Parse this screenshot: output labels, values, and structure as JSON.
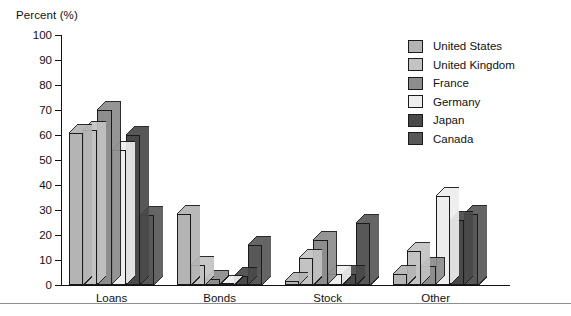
{
  "chart_data": {
    "type": "bar",
    "title": "",
    "ylabel": "Percent (%)",
    "xlabel": "",
    "ylim": [
      0,
      100
    ],
    "yticks": [
      0,
      10,
      20,
      30,
      40,
      50,
      60,
      70,
      80,
      90,
      100
    ],
    "grid": false,
    "legend_position": "top-right",
    "categories": [
      "Loans",
      "Bonds",
      "Stock",
      "Other"
    ],
    "series": [
      {
        "name": "United States",
        "color": "#b4b4b4",
        "values": [
          61,
          28.5,
          1.5,
          4.5
        ]
      },
      {
        "name": "United Kingdom",
        "color": "#c3c3c3",
        "values": [
          62,
          8,
          11,
          13.5
        ]
      },
      {
        "name": "France",
        "color": "#8d8d8d",
        "values": [
          70,
          2.5,
          18,
          7.5
        ]
      },
      {
        "name": "Germany",
        "color": "#ededed",
        "values": [
          54,
          0.6,
          4.5,
          35.5
        ]
      },
      {
        "name": "Japan",
        "color": "#494949",
        "values": [
          60,
          3.5,
          4.5,
          26
        ]
      },
      {
        "name": "Canada",
        "color": "#585858",
        "values": [
          28,
          16,
          25,
          28.5
        ]
      }
    ]
  }
}
